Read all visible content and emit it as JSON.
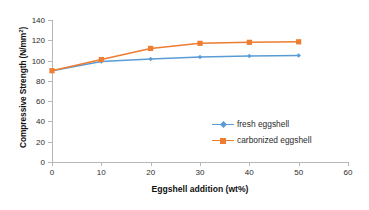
{
  "chart_data": {
    "type": "line",
    "title": "",
    "xlabel": "Eggshell addition (wt%)",
    "ylabel": "Compressive Strength (N/mm²)",
    "ylabel_base": "Compressive Strength (N/mm",
    "ylabel_sup": "2",
    "ylabel_close": ")",
    "x": [
      0,
      10,
      20,
      30,
      40,
      50
    ],
    "xlim": [
      0,
      60
    ],
    "ylim": [
      0,
      140
    ],
    "xticks": [
      "0",
      "10",
      "20",
      "30",
      "40",
      "50",
      "60"
    ],
    "xtick_values": [
      0,
      10,
      20,
      30,
      40,
      50,
      60
    ],
    "yticks": [
      "0",
      "20",
      "40",
      "60",
      "80",
      "100",
      "120",
      "140"
    ],
    "ytick_values": [
      0,
      20,
      40,
      60,
      80,
      100,
      120,
      140
    ],
    "grid": false,
    "legend_position": "center-right",
    "series": [
      {
        "name": "fresh eggshell",
        "color": "#5b9bd5",
        "marker": "diamond",
        "values": [
          90,
          99,
          101.5,
          103.5,
          104.5,
          105
        ]
      },
      {
        "name": "carbonized eggshell",
        "color": "#ed7d31",
        "marker": "square",
        "values": [
          90,
          101,
          112,
          117,
          118,
          118.5
        ]
      }
    ]
  },
  "legend": {
    "items": [
      {
        "label": "fresh eggshell"
      },
      {
        "label": "carbonized eggshell"
      }
    ]
  },
  "colors": {
    "fresh": "#5b9bd5",
    "carbonized": "#ed7d31",
    "axis": "#b7b7b7",
    "text": "#2b2b2b",
    "background": "#ffffff"
  }
}
